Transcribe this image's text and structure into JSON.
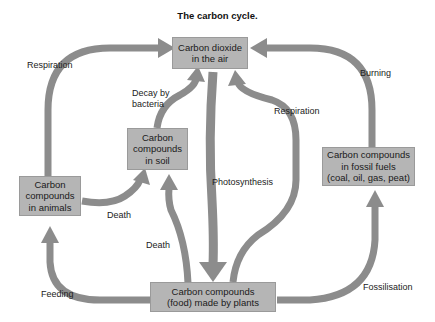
{
  "title": "The carbon cycle.",
  "colors": {
    "box_fill": "#b5b5b5",
    "arrow": "#8c8c8c",
    "text": "#1a1a1a"
  },
  "nodes": {
    "air": "Carbon dioxide\nin the air",
    "soil": "Carbon\ncompounds\nin soil",
    "animals": "Carbon\ncompounds\nin animals",
    "fossil": "Carbon compounds\nin fossil fuels\n(coal, oil, gas, peat)",
    "plants": "Carbon compounds\n(food) made by plants"
  },
  "labels": {
    "respiration_animals": "Respiration",
    "decay": "Decay by\nbacteria",
    "respiration_plants": "Respiration",
    "burning": "Burning",
    "photosynthesis": "Photosynthesis",
    "death_animals": "Death",
    "death_plants": "Death",
    "feeding": "Feeding",
    "fossilisation": "Fossilisation"
  },
  "edges": [
    {
      "from": "animals",
      "to": "air",
      "label": "Respiration"
    },
    {
      "from": "soil",
      "to": "air",
      "label": "Decay by bacteria"
    },
    {
      "from": "plants",
      "to": "air",
      "label": "Respiration"
    },
    {
      "from": "fossil",
      "to": "air",
      "label": "Burning"
    },
    {
      "from": "air",
      "to": "plants",
      "label": "Photosynthesis"
    },
    {
      "from": "animals",
      "to": "soil",
      "label": "Death"
    },
    {
      "from": "plants",
      "to": "soil",
      "label": "Death"
    },
    {
      "from": "plants",
      "to": "animals",
      "label": "Feeding"
    },
    {
      "from": "plants",
      "to": "fossil",
      "label": "Fossilisation"
    }
  ]
}
